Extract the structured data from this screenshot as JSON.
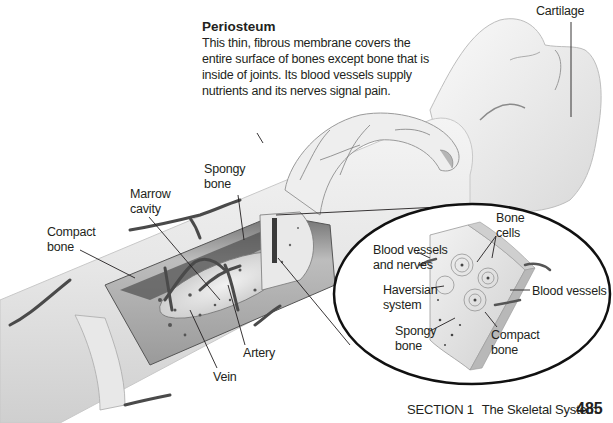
{
  "figure": {
    "periosteum": {
      "title": "Periosteum",
      "description": "This thin, fibrous membrane covers the entire surface of bones except bone that is inside of joints. Its blood vessels supply nutrients and its nerves signal pain."
    },
    "labels": {
      "cartilage": "Cartilage",
      "spongy_bone_1": "Spongy",
      "spongy_bone_2": "bone",
      "marrow_cavity_1": "Marrow",
      "marrow_cavity_2": "cavity",
      "compact_bone_1": "Compact",
      "compact_bone_2": "bone",
      "artery": "Artery",
      "vein": "Vein"
    },
    "inset_labels": {
      "bone_cells_1": "Bone",
      "bone_cells_2": "cells",
      "blood_vessels_nerves_1": "Blood vessels",
      "blood_vessels_nerves_2": "and nerves",
      "haversian_1": "Haversian",
      "haversian_2": "system",
      "blood_vessels": "Blood vessels",
      "spongy_bone_1": "Spongy",
      "spongy_bone_2": "bone",
      "compact_bone_1": "Compact",
      "compact_bone_2": "bone"
    }
  },
  "footer": {
    "section": "SECTION 1",
    "chapter": "The Skeletal System",
    "page": "485"
  }
}
